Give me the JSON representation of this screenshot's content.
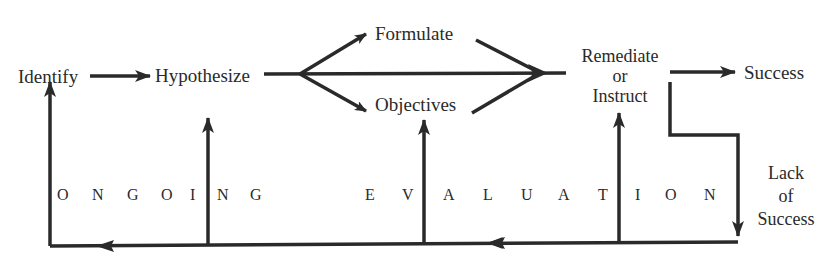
{
  "diagram": {
    "type": "flow",
    "nodes": {
      "identify": "Identify",
      "hypothesize": "Hypothesize",
      "formulate": "Formulate",
      "objectives": "Objectives",
      "remediate_line1": "Remediate",
      "remediate_line2": "or",
      "remediate_line3": "Instruct",
      "success": "Success",
      "lack_line1": "Lack",
      "lack_line2": "of",
      "lack_line3": "Success"
    },
    "feedback_label": {
      "word1": [
        "O",
        "N",
        "G",
        "O",
        "I",
        "N",
        "G"
      ],
      "word2": [
        "E",
        "V",
        "A",
        "L",
        "U",
        "A",
        "T",
        "I",
        "O",
        "N"
      ],
      "full": "ONGOING EVALUATION"
    },
    "edges": [
      {
        "from": "Identify",
        "to": "Hypothesize"
      },
      {
        "from": "Hypothesize",
        "to": "Formulate"
      },
      {
        "from": "Hypothesize",
        "to": "Objectives"
      },
      {
        "from": "Formulate",
        "to": "Remediate or Instruct"
      },
      {
        "from": "Objectives",
        "to": "Remediate or Instruct"
      },
      {
        "from": "Remediate or Instruct",
        "to": "Success"
      },
      {
        "from": "Remediate or Instruct",
        "to": "Lack of Success"
      },
      {
        "from": "Lack of Success",
        "to": "Ongoing Evaluation loop"
      },
      {
        "from": "Ongoing Evaluation loop",
        "to": "Identify"
      },
      {
        "from": "Ongoing Evaluation loop",
        "to": "Hypothesize"
      },
      {
        "from": "Ongoing Evaluation loop",
        "to": "Objectives"
      },
      {
        "from": "Ongoing Evaluation loop",
        "to": "Remediate or Instruct"
      }
    ],
    "colors": {
      "ink": "#2a2a2a",
      "background": "#ffffff"
    }
  }
}
